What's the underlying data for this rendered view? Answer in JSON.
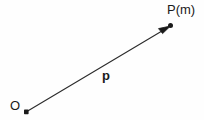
{
  "figure": {
    "type": "vector-diagram",
    "background_color": "#fefefe",
    "stroke_color": "#1a1a1a",
    "width": 204,
    "height": 120,
    "labels": {
      "origin": "O",
      "target": "P(m)",
      "vector": "p"
    },
    "points": [
      {
        "name": "origin-point",
        "label": "O",
        "x": 26,
        "y": 112
      },
      {
        "name": "target-point",
        "label": "P(m)",
        "x": 171,
        "y": 26
      }
    ],
    "arrow": {
      "name": "position-vector-arrow",
      "label": "p",
      "from_x": 26,
      "from_y": 112,
      "to_x": 171,
      "to_y": 26,
      "has_arrowhead": true,
      "line_width": 1
    }
  }
}
